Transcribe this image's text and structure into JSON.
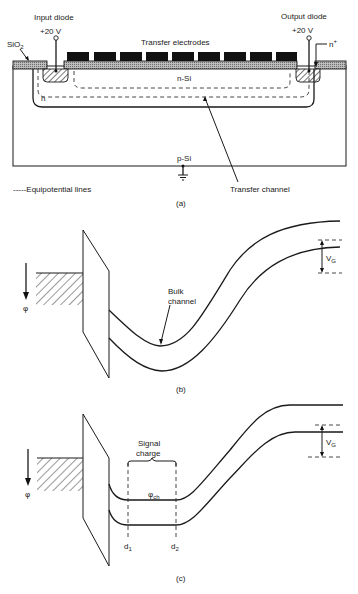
{
  "figure": {
    "panels": [
      {
        "id": "a",
        "caption": "(a)",
        "labels": {
          "input_diode": "Input diode",
          "input_voltage": "+20 V",
          "oxide": "SiO",
          "oxide_sub": "2",
          "transfer_electrodes": "Transfer electrodes",
          "output_diode": "Output diode",
          "output_voltage": "+20 V",
          "n_plus": "n",
          "n_plus_sup": "+",
          "n_si": "n-Si",
          "n": "n",
          "p_si": "p-Si",
          "legend": "-----Equipotential lines",
          "transfer_channel": "Transfer channel"
        },
        "electrode_count": 9
      },
      {
        "id": "b",
        "caption": "(b)",
        "labels": {
          "phi": "φ",
          "bulk_channel_line1": "Bulk",
          "bulk_channel_line2": "channel",
          "vg": "V",
          "vg_sub": "G"
        }
      },
      {
        "id": "c",
        "caption": "(c)",
        "labels": {
          "phi": "φ",
          "signal_charge_line1": "Signal",
          "signal_charge_line2": "charge",
          "phi_ch": "φ",
          "phi_ch_sub": "ch",
          "d1": "d",
          "d1_sub": "1",
          "d2": "d",
          "d2_sub": "2",
          "vg": "V",
          "vg_sub": "G"
        }
      }
    ]
  }
}
